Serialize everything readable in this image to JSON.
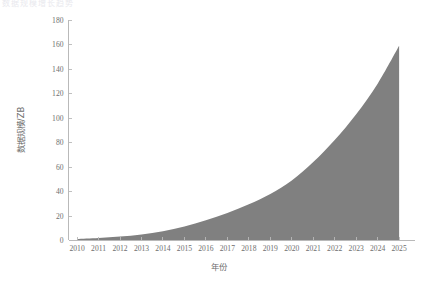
{
  "figure": {
    "top_text_fragment": "数据规模增长趋势",
    "background_color": "#ffffff"
  },
  "chart_data": {
    "type": "area",
    "title": "",
    "xlabel": "年份",
    "ylabel": "数据规模/ZB",
    "fill_color": "#808080",
    "axis_color": "#b9b9b9",
    "label_color": "#6e6e6e",
    "grid": false,
    "legend": null,
    "xlim": [
      2009.6,
      2025.6
    ],
    "ylim": [
      0,
      180
    ],
    "ytick_step": 20,
    "categories": [
      "2010",
      "2011",
      "2012",
      "2013",
      "2014",
      "2015",
      "2016",
      "2017",
      "2018",
      "2019",
      "2020",
      "2021",
      "2022",
      "2023",
      "2024",
      "2025"
    ],
    "xtick_labels": [
      "2010",
      "2011",
      "2012",
      "2013",
      "2014",
      "2015",
      "2016",
      "2017",
      "2018",
      "2019",
      "2020",
      "2021",
      "2022",
      "2023",
      "2024",
      "2025"
    ],
    "ytick_labels": [
      "0",
      "20",
      "40",
      "60",
      "80",
      "100",
      "120",
      "140",
      "160",
      "180"
    ],
    "x": [
      2010,
      2011,
      2012,
      2013,
      2014,
      2015,
      2016,
      2017,
      2018,
      2019,
      2020,
      2021,
      2022,
      2023,
      2024,
      2025
    ],
    "values": [
      1.2,
      2.0,
      3.2,
      5.0,
      7.6,
      11.5,
      16.5,
      22.5,
      29.5,
      38.0,
      49.0,
      64.0,
      82.0,
      103.0,
      128.0,
      159.0
    ],
    "series": [
      {
        "name": "数据规模",
        "values": [
          1.2,
          2.0,
          3.2,
          5.0,
          7.6,
          11.5,
          16.5,
          22.5,
          29.5,
          38.0,
          49.0,
          64.0,
          82.0,
          103.0,
          128.0,
          159.0
        ]
      }
    ]
  }
}
